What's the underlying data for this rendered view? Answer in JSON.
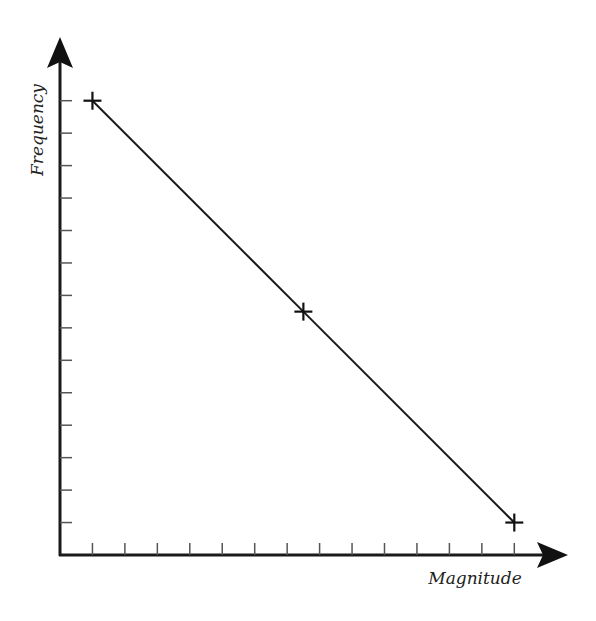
{
  "chart_data": {
    "type": "line",
    "title": "",
    "xlabel": "Magnitude",
    "ylabel": "Frequency",
    "x_ticks": 14,
    "y_ticks": 14,
    "tick_labels_shown": false,
    "grid": false,
    "legend": null,
    "marker": "plus",
    "x": [
      1,
      7.5,
      14
    ],
    "values": [
      14,
      7.5,
      1
    ],
    "xlim": [
      0,
      14.5
    ],
    "ylim": [
      0,
      14.5
    ]
  },
  "colors": {
    "axis": "#1a1a1a",
    "line": "#1a1a1a",
    "tick": "#555555",
    "background": "#ffffff"
  }
}
